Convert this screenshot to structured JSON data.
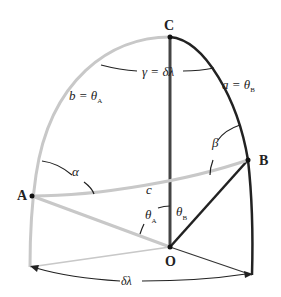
{
  "diagram": {
    "type": "spherical-triangle",
    "points": {
      "C": {
        "label": "C"
      },
      "A": {
        "label": "A"
      },
      "B": {
        "label": "B"
      },
      "O": {
        "label": "O"
      }
    },
    "labels": {
      "gamma_eq": "γ = δλ",
      "b_side": "b = θ",
      "b_sub": "A",
      "a_side": "a = θ",
      "a_sub": "B",
      "alpha": "α",
      "beta": "β",
      "c_side": "c",
      "thetaA": "θ",
      "thetaA_sub": "A",
      "thetaB": "θ",
      "thetaB_sub": "B",
      "delta_lambda": "δλ"
    },
    "colors": {
      "light_line": "#c8c8c8",
      "dark_line": "#222222",
      "text": "#222222"
    }
  }
}
